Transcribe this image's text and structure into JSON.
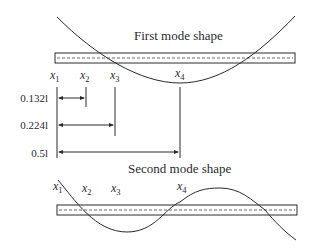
{
  "diagram": {
    "first_mode": {
      "title": "First mode shape",
      "points": [
        {
          "name": "x",
          "sub": "1"
        },
        {
          "name": "x",
          "sub": "2"
        },
        {
          "name": "x",
          "sub": "3"
        },
        {
          "name": "x",
          "sub": "4"
        }
      ]
    },
    "dimensions": [
      {
        "label": "0.132l",
        "from": "x1",
        "to": "x2"
      },
      {
        "label": "0.224l",
        "from": "x1",
        "to": "x3"
      },
      {
        "label": "0.5l",
        "from": "x1",
        "to": "x4"
      }
    ],
    "second_mode": {
      "title": "Second mode shape",
      "points": [
        {
          "name": "x",
          "sub": "1"
        },
        {
          "name": "x",
          "sub": "2"
        },
        {
          "name": "x",
          "sub": "3"
        },
        {
          "name": "x",
          "sub": "4"
        }
      ]
    },
    "colors": {
      "line": "#2a2a2a",
      "background": "#ffffff"
    }
  }
}
